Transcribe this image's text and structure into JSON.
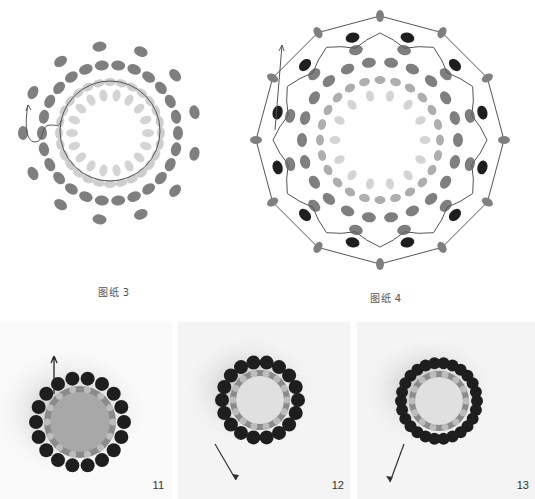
{
  "diagrams": [
    {
      "id": "diagram-3",
      "caption": "图纸 3"
    },
    {
      "id": "diagram-4",
      "caption": "图纸 4"
    }
  ],
  "photos": [
    {
      "id": "photo-11",
      "number": "11",
      "arrow": "up"
    },
    {
      "id": "photo-12",
      "number": "12",
      "arrow": "down-left"
    },
    {
      "id": "photo-13",
      "number": "13",
      "arrow": "down-left"
    }
  ],
  "colors": {
    "bead_light": "#c9c9c9",
    "bead_mid": "#9a9a9a",
    "bead_outer": "#7f7f7f",
    "bead_black": "#1e1e1e",
    "thread": "#555555",
    "background": "#ffffff"
  }
}
